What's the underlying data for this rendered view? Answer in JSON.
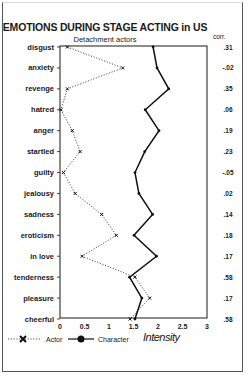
{
  "chart_data": {
    "type": "line",
    "title": "EMOTIONS DURING STAGE ACTING in US",
    "subtitle": "Detachment actors",
    "orientation": "horizontal-profile",
    "xlabel": "Intensity",
    "ylabel": "",
    "xlim": [
      0,
      3
    ],
    "xticks": [
      "0",
      "0.5",
      "1",
      "1.5",
      "2",
      "2.5",
      "3"
    ],
    "xtick_values": [
      0,
      0.5,
      1,
      1.5,
      2,
      2.5,
      3
    ],
    "categories": [
      "disgust",
      "anxiety",
      "revenge",
      "hatred",
      "anger",
      "startled",
      "guilty",
      "jealousy",
      "sadness",
      "eroticism",
      "in love",
      "tenderness",
      "pleasure",
      "cheerful"
    ],
    "series": [
      {
        "name": "Actor",
        "style": "dotted",
        "marker": "x",
        "values": [
          0.15,
          1.28,
          0.15,
          0.02,
          0.25,
          0.41,
          0.07,
          0.31,
          0.85,
          1.15,
          0.45,
          1.53,
          1.83,
          1.43
        ]
      },
      {
        "name": "Character",
        "style": "solid",
        "marker": "dot",
        "values": [
          1.9,
          1.98,
          2.22,
          1.74,
          2.02,
          1.73,
          1.53,
          1.61,
          1.89,
          1.51,
          1.97,
          1.42,
          1.67,
          1.53
        ]
      }
    ],
    "corr_header": "corr.",
    "correlations": [
      ".31",
      "-.02",
      ".35",
      ".06",
      ".19",
      ".23",
      "-.05",
      ".02",
      ".14",
      ".18",
      ".17",
      ".58",
      ".17",
      ".58"
    ],
    "legend": {
      "placement": "bottom",
      "entries": [
        "Actor",
        "Character"
      ],
      "axis_title": "Intensity"
    },
    "grid": false
  },
  "colors": {
    "ink": "#1a1a1a",
    "actor_line": "#555555",
    "character_line": "#111111"
  }
}
